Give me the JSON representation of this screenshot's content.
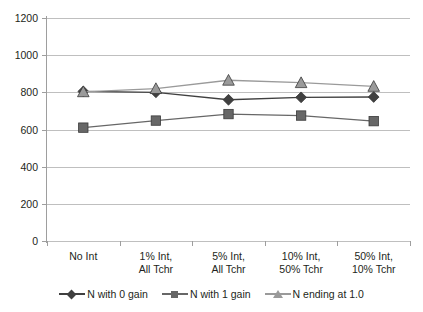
{
  "chart_data": {
    "type": "line",
    "title": "",
    "xlabel": "",
    "ylabel": "",
    "ylim": [
      0,
      1200
    ],
    "ytick_step": 200,
    "yticks": [
      "1200",
      "1000",
      "800",
      "600",
      "400",
      "200",
      "0"
    ],
    "grid": true,
    "legend_position": "bottom",
    "categories": [
      "No Int",
      "1% Int,\nAll Tchr",
      "5% Int,\nAll Tchr",
      "10% Int,\n50% Tchr",
      "50% Int,\n10% Tchr"
    ],
    "category_lines": [
      [
        "No Int",
        ""
      ],
      [
        "1% Int,",
        "All Tchr"
      ],
      [
        "5% Int,",
        "All Tchr"
      ],
      [
        "10% Int,",
        "50% Tchr"
      ],
      [
        "50% Int,",
        "10% Tchr"
      ]
    ],
    "series": [
      {
        "name": "N with 0 gain",
        "marker": "diamond",
        "color": "#404040",
        "values": [
          805,
          800,
          760,
          773,
          775
        ]
      },
      {
        "name": "N with 1 gain",
        "marker": "square",
        "color": "#676767",
        "values": [
          610,
          648,
          683,
          675,
          645
        ]
      },
      {
        "name": "N ending at 1.0",
        "marker": "triangle",
        "color": "#9a9a9a",
        "values": [
          803,
          820,
          865,
          852,
          832
        ]
      }
    ]
  },
  "legend": {
    "items": [
      {
        "label": "N with 0 gain",
        "marker": "diamond",
        "color": "#404040"
      },
      {
        "label": "N with 1 gain",
        "marker": "square",
        "color": "#676767"
      },
      {
        "label": "N ending at 1.0",
        "marker": "triangle",
        "color": "#9a9a9a"
      }
    ]
  },
  "axis": {
    "y_labels": [
      "1200",
      "1000",
      "800",
      "600",
      "400",
      "200",
      "0"
    ]
  },
  "colors": {
    "grid": "#bfbfbf",
    "axis": "#9e9e9e",
    "text": "#231f20",
    "background": "#ffffff"
  }
}
